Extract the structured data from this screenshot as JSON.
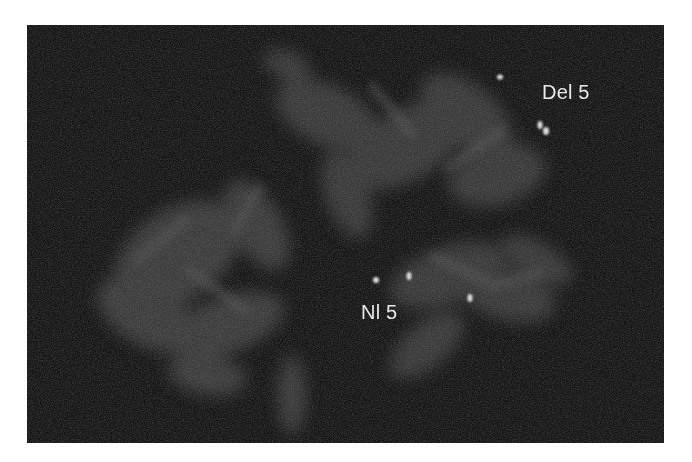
{
  "image": {
    "type": "fluorescence-in-situ-hybridization-micrograph",
    "colors": {
      "page_background": "#ffffff",
      "panel_background": "#141414",
      "chromosome_haze": "#5a5a5a",
      "signal": "#dcdcdc",
      "label_text": "#e8e8e8"
    }
  },
  "labels": {
    "deleted": "Del 5",
    "normal": "Nl 5"
  }
}
